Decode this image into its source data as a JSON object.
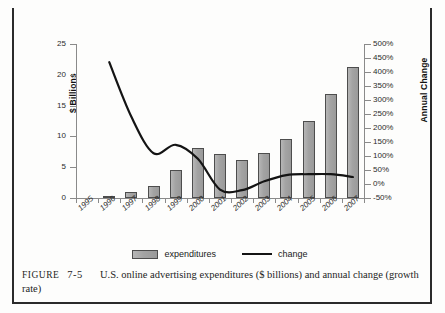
{
  "figure": {
    "caption_label": "FIGURE",
    "caption_number": "7-5",
    "caption_text": "U.S. online advertising expenditures ($ billions) and annual change (growth rate)"
  },
  "legend": {
    "items": [
      {
        "label": "expenditures",
        "marker": "bar-swatch",
        "color": "#a3a3a3"
      },
      {
        "label": "change",
        "marker": "line-swatch",
        "color": "#141414"
      }
    ]
  },
  "axes": {
    "left_title": "$ Billions",
    "right_title": "Annual Change",
    "left_ticks": [
      "0",
      "5",
      "10",
      "15",
      "20",
      "25"
    ],
    "right_ticks": [
      "-50%",
      "0%",
      "50%",
      "100%",
      "150%",
      "200%",
      "250%",
      "300%",
      "350%",
      "400%",
      "450%",
      "500%"
    ]
  },
  "chart_data": {
    "type": "bar",
    "title": "U.S. online advertising expenditures ($ billions) and annual change (growth rate)",
    "xlabel": "",
    "ylabel": "$ Billions",
    "y2label": "Annual Change",
    "ylim": [
      0,
      25
    ],
    "y2lim": [
      -50,
      500
    ],
    "grid": false,
    "legend_position": "bottom-center",
    "categories": [
      "1995",
      "1996",
      "1997",
      "1998",
      "1999",
      "2000",
      "2001",
      "2002",
      "2003",
      "2004",
      "2005",
      "2006",
      "2007"
    ],
    "series": [
      {
        "name": "expenditures",
        "type": "bar",
        "axis": "left",
        "unit": "$ billions",
        "color": "#a3a3a3",
        "values": [
          0,
          0.3,
          0.9,
          2.0,
          4.6,
          8.1,
          7.1,
          6.1,
          7.3,
          9.6,
          12.5,
          16.9,
          21.2
        ]
      },
      {
        "name": "change",
        "type": "line",
        "axis": "right",
        "unit": "percent",
        "color": "#141414",
        "values": [
          null,
          435,
          240,
          110,
          140,
          90,
          -20,
          -22,
          10,
          32,
          35,
          35,
          25
        ]
      }
    ]
  }
}
